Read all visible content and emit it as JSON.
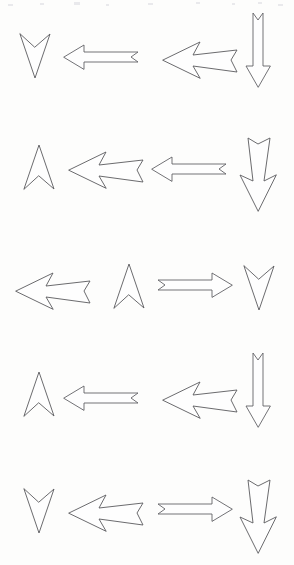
{
  "page": {
    "background_color": "#fdfdfc",
    "stroke_color": "#5a5a5e",
    "fill_color": "#fefefe",
    "width": 294,
    "height": 565,
    "figure_count": 20,
    "row_count": 5,
    "columns_per_row": 4
  },
  "rows": [
    {
      "index": 1,
      "label": "row-1",
      "glyphs": [
        {
          "name": "concave-arrowhead-down",
          "direction": "down",
          "style": "concave-head",
          "position": "left"
        },
        {
          "name": "thin-arrow-left",
          "direction": "left",
          "style": "thin-shaft-fletched",
          "position": "center-left"
        },
        {
          "name": "block-arrow-left",
          "direction": "left",
          "style": "thick-block-notched",
          "position": "center-right"
        },
        {
          "name": "vertical-thin-arrow-down",
          "direction": "down",
          "style": "thin-shaft-fletched",
          "position": "right"
        }
      ]
    },
    {
      "index": 2,
      "label": "row-2",
      "glyphs": [
        {
          "name": "concave-arrowhead-up",
          "direction": "up",
          "style": "concave-head",
          "position": "left"
        },
        {
          "name": "block-arrow-left",
          "direction": "left",
          "style": "thick-block-notched",
          "position": "center-left"
        },
        {
          "name": "thin-arrow-left",
          "direction": "left",
          "style": "thin-shaft-fletched",
          "position": "center-right"
        },
        {
          "name": "vertical-block-arrow-down",
          "direction": "down",
          "style": "thick-block-notched",
          "position": "right"
        }
      ]
    },
    {
      "index": 3,
      "label": "row-3",
      "glyphs": [
        {
          "name": "block-arrow-left",
          "direction": "left",
          "style": "thick-block-notched",
          "position": "left"
        },
        {
          "name": "concave-arrowhead-up",
          "direction": "up",
          "style": "concave-head",
          "position": "center-left"
        },
        {
          "name": "thin-arrow-right",
          "direction": "right",
          "style": "thin-shaft-fletched",
          "position": "center-right"
        },
        {
          "name": "concave-arrowhead-down",
          "direction": "down",
          "style": "concave-head",
          "position": "right"
        }
      ]
    },
    {
      "index": 4,
      "label": "row-4",
      "glyphs": [
        {
          "name": "concave-arrowhead-up",
          "direction": "up",
          "style": "concave-head",
          "position": "left"
        },
        {
          "name": "thin-arrow-left",
          "direction": "left",
          "style": "thin-shaft-fletched",
          "position": "center-left"
        },
        {
          "name": "block-arrow-left",
          "direction": "left",
          "style": "thick-block-notched",
          "position": "center-right"
        },
        {
          "name": "vertical-thin-arrow-down",
          "direction": "down",
          "style": "thin-shaft-fletched",
          "position": "right"
        }
      ]
    },
    {
      "index": 5,
      "label": "row-5",
      "glyphs": [
        {
          "name": "concave-arrowhead-down",
          "direction": "down",
          "style": "concave-head",
          "position": "left"
        },
        {
          "name": "block-arrow-left",
          "direction": "left",
          "style": "thick-block-notched",
          "position": "center-left"
        },
        {
          "name": "thin-arrow-right",
          "direction": "right",
          "style": "thin-shaft-fletched",
          "position": "center-right"
        },
        {
          "name": "vertical-block-arrow-down",
          "direction": "down",
          "style": "thick-block-notched",
          "position": "right"
        }
      ]
    }
  ],
  "paths": {
    "concave_head_down": "M 20 34 L 35 78 L 50 34 L 35 47 Z",
    "concave_head_up": "M 20 76 L 35 32 L 50 76 L 35 63 Z",
    "thin_arrow_left": "M 64 57 L 84 45 L 84 52 L 138 52 L 131 57 L 138 62 L 84 62 L 84 69 Z",
    "thin_arrow_right": "M 86 57 L 66 45 L 66 52 L 12 52 L 19 57 L 12 62 L 66 62 L 66 69 Z",
    "block_arrow_left": "M 163 60 L 200 42 L 193 55 L 237 50 L 231 60 L 237 72 L 193 66 L 200 78 Z",
    "vertical_thin_arrow_down": "M 258 105 L 246 84 L 253 84 L 253 31 L 258 38 L 263 31 L 263 84 L 270 84 Z",
    "vertical_block_arrow_down": "M 258 101 L 240 65 L 253 71 L 248 28 L 258 34 L 270 28 L 264 71 L 276 65 Z"
  },
  "specks": [
    {
      "x": 8,
      "y": 4,
      "w": 5,
      "h": 2
    },
    {
      "x": 40,
      "y": 3,
      "w": 4,
      "h": 2
    },
    {
      "x": 74,
      "y": 2,
      "w": 6,
      "h": 3
    },
    {
      "x": 106,
      "y": 4,
      "w": 3,
      "h": 2
    },
    {
      "x": 148,
      "y": 3,
      "w": 5,
      "h": 2
    },
    {
      "x": 196,
      "y": 2,
      "w": 4,
      "h": 2
    },
    {
      "x": 232,
      "y": 3,
      "w": 3,
      "h": 2
    },
    {
      "x": 258,
      "y": 2,
      "w": 4,
      "h": 2
    },
    {
      "x": 278,
      "y": 4,
      "w": 5,
      "h": 2
    }
  ]
}
